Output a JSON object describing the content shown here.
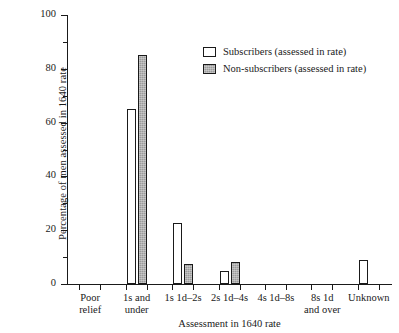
{
  "chart_data": {
    "type": "bar",
    "title": "",
    "xlabel": "Assessment in 1640 rate",
    "ylabel": "Percentage of men assessed in 1640 rate",
    "ylim": [
      0,
      100
    ],
    "ytick_major": [
      0,
      20,
      40,
      60,
      80,
      100
    ],
    "ytick_minor": [
      10,
      30,
      50,
      70,
      90
    ],
    "grid": false,
    "legend_position": "upper center",
    "categories": [
      "Poor relief",
      "1s and under",
      "1s 1d–2s",
      "2s 1d–4s",
      "4s 1d–8s",
      "8s 1d and over",
      "Unknown"
    ],
    "category_lines": [
      [
        "Poor",
        "relief"
      ],
      [
        "1s and",
        "under"
      ],
      [
        "1s 1d–2s",
        ""
      ],
      [
        "2s 1d–4s",
        ""
      ],
      [
        "4s 1d–8s",
        ""
      ],
      [
        "8s 1d",
        "and over"
      ],
      [
        "Unknown",
        ""
      ]
    ],
    "series": [
      {
        "name": "Subscribers (assessed in rate)",
        "color": "#ffffff",
        "values": [
          0,
          65,
          22.5,
          5,
          0,
          0,
          9
        ]
      },
      {
        "name": "Non-subscribers (assessed in rate)",
        "color": "#9b9b9b",
        "values": [
          0,
          85,
          7.5,
          8,
          0,
          0,
          0
        ]
      }
    ]
  },
  "legend": {
    "items": [
      {
        "label": "Subscribers (assessed in rate)",
        "swatch": "white-square-icon"
      },
      {
        "label": "Non-subscribers (assessed in rate)",
        "swatch": "gray-square-icon"
      }
    ]
  },
  "axes": {
    "y_title": "Percentage of men assessed in 1640 rate",
    "x_title": "Assessment in 1640 rate",
    "y_labels": [
      "0",
      "20",
      "40",
      "60",
      "80",
      "100"
    ]
  }
}
